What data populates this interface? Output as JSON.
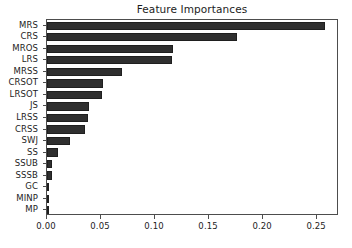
{
  "chart_data": {
    "type": "bar",
    "orientation": "horizontal",
    "title": "Feature Importances",
    "xlabel": "",
    "ylabel": "",
    "grid": false,
    "legend": false,
    "xlim": [
      0.0,
      0.2703
    ],
    "xticks": [
      0.0,
      0.05,
      0.1,
      0.15,
      0.2,
      0.25
    ],
    "xtick_labels": [
      "0.00",
      "0.05",
      "0.10",
      "0.15",
      "0.20",
      "0.25"
    ],
    "categories": [
      "MRS",
      "CRS",
      "MROS",
      "LRS",
      "MRSS",
      "CRSOT",
      "LRSOT",
      "JS",
      "LRSS",
      "CRSS",
      "SWJ",
      "SS",
      "SSUB",
      "SSSB",
      "GC",
      "MINP",
      "MP"
    ],
    "values": [
      0.257,
      0.176,
      0.117,
      0.116,
      0.069,
      0.052,
      0.051,
      0.039,
      0.038,
      0.035,
      0.021,
      0.01,
      0.005,
      0.005,
      0.002,
      0.0006,
      0.0004
    ],
    "bar_color": "#2f2f2f",
    "axis_color": "#4d4d4d",
    "background_color": "#ffffff"
  }
}
